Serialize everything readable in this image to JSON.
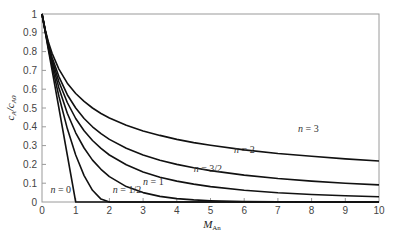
{
  "chart_data": {
    "type": "line",
    "title": "",
    "xlabel": "M_An",
    "ylabel": "c_A/c_A0",
    "xlim": [
      0,
      10
    ],
    "ylim": [
      0,
      1
    ],
    "grid": false,
    "legend": "inline curve labels",
    "x_ticks": [
      "0",
      "1",
      "2",
      "3",
      "4",
      "5",
      "6",
      "7",
      "8",
      "9",
      "10"
    ],
    "y_ticks": [
      "0",
      "0.1",
      "0.2",
      "0.3",
      "0.4",
      "0.5",
      "0.6",
      "0.7",
      "0.8",
      "0.9",
      "1"
    ],
    "x": [
      0,
      0.1,
      0.2,
      0.3,
      0.5,
      0.75,
      1,
      1.25,
      1.5,
      1.75,
      2,
      2.5,
      3,
      3.5,
      4,
      4.5,
      5,
      6,
      7,
      8,
      9,
      10
    ],
    "series": [
      {
        "name": "n = 0",
        "values": [
          1,
          0.9,
          0.8,
          0.7,
          0.5,
          0.25,
          0,
          0,
          0,
          0,
          0,
          0,
          0,
          0,
          0,
          0,
          0,
          0,
          0,
          0,
          0,
          0
        ]
      },
      {
        "name": "n = 1/2",
        "values": [
          1,
          0.9025,
          0.81,
          0.7225,
          0.5625,
          0.3906,
          0.25,
          0.1406,
          0.0625,
          0.0156,
          0,
          0,
          0,
          0,
          0,
          0,
          0,
          0,
          0,
          0,
          0,
          0
        ]
      },
      {
        "name": "n = 1",
        "values": [
          1,
          0.905,
          0.819,
          0.741,
          0.607,
          0.472,
          0.368,
          0.287,
          0.223,
          0.174,
          0.135,
          0.082,
          0.05,
          0.03,
          0.018,
          0.011,
          0.007,
          0.002,
          0.001,
          0,
          0,
          0
        ]
      },
      {
        "name": "n = 3/2",
        "values": [
          1,
          0.907,
          0.826,
          0.756,
          0.64,
          0.529,
          0.444,
          0.379,
          0.327,
          0.285,
          0.25,
          0.198,
          0.16,
          0.132,
          0.111,
          0.095,
          0.082,
          0.0625,
          0.049,
          0.04,
          0.033,
          0.028
        ]
      },
      {
        "name": "n = 2",
        "values": [
          1,
          0.909,
          0.833,
          0.769,
          0.667,
          0.571,
          0.5,
          0.444,
          0.4,
          0.364,
          0.333,
          0.286,
          0.25,
          0.222,
          0.2,
          0.182,
          0.167,
          0.143,
          0.125,
          0.111,
          0.1,
          0.091
        ]
      },
      {
        "name": "n = 3",
        "values": [
          1,
          0.913,
          0.845,
          0.791,
          0.707,
          0.632,
          0.577,
          0.535,
          0.5,
          0.471,
          0.447,
          0.408,
          0.378,
          0.354,
          0.333,
          0.316,
          0.302,
          0.277,
          0.258,
          0.243,
          0.229,
          0.218
        ]
      }
    ],
    "annotations": [
      {
        "text": "n = 0",
        "x": 0.25,
        "y": 0.05
      },
      {
        "text": "n = 1/2",
        "x": 2.1,
        "y": 0.05
      },
      {
        "text": "n = 1",
        "x": 3.0,
        "y": 0.09
      },
      {
        "text": "n = 3/2",
        "x": 4.5,
        "y": 0.16
      },
      {
        "text": "n = 2",
        "x": 5.7,
        "y": 0.26
      },
      {
        "text": "n = 3",
        "x": 7.6,
        "y": 0.37
      }
    ]
  },
  "labels": {
    "x_main": "M",
    "x_sub": "An",
    "y_c": "c",
    "y_a": "A",
    "y_slash": "/c",
    "y_a0": "A0"
  }
}
